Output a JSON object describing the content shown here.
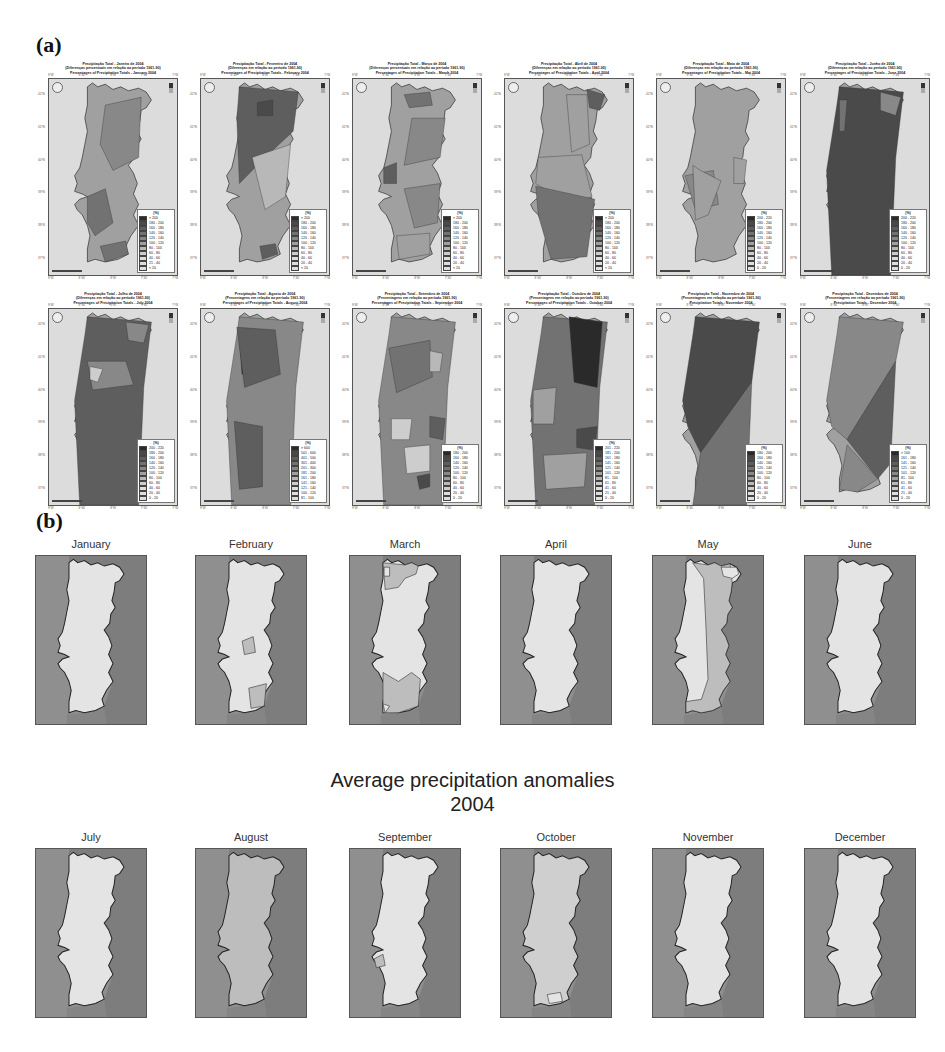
{
  "figure": {
    "panel_a_label": "(a)",
    "panel_b_label": "(b)",
    "center_title_line1": "Average precipitation anomalies",
    "center_title_line2": "2004"
  },
  "panel_a": {
    "legend_unit": "(%)",
    "tick_labels": {
      "top": [
        "9°W",
        "8°30'",
        "8°W",
        "7°30'",
        "7°W"
      ],
      "left": [
        "42°N",
        "41°N",
        "40°N",
        "39°N",
        "38°N",
        "37°N"
      ]
    },
    "maps": [
      {
        "title1": "Precipitação Total - Janeiro de 2004",
        "title2": "(Diferenças percentuais em relação ao período 1961-90)",
        "title3": "Percentages of Precipitation Totals - January 2004",
        "legend": [
          "> 200",
          "180 - 200",
          "160 - 180",
          "140 - 160",
          "120 - 140",
          "100 - 120",
          "80 - 100",
          "60 - 80",
          "40 - 60",
          "21 - 40",
          "< 20"
        ]
      },
      {
        "title1": "Precipitação Total - Fevereiro de 2004",
        "title2": "(Diferenças em relação ao período 1961-90)",
        "title3": "Percentages of Precipitation Totals - February 2004",
        "legend": [
          "> 200",
          "180 - 200",
          "160 - 180",
          "140 - 160",
          "120 - 140",
          "100 - 120",
          "80 - 100",
          "60 - 80",
          "40 - 60",
          "20 - 40",
          "< 20"
        ]
      },
      {
        "title1": "Precipitação Total - Março de 2004",
        "title2": "(Diferenças percentuais em relação ao período 1961-90)",
        "title3": "Percentages of Precipitation Totals - March 2004",
        "legend": [
          "> 200",
          "180 - 200",
          "160 - 180",
          "140 - 160",
          "120 - 140",
          "100 - 120",
          "80 - 100",
          "60 - 80",
          "40 - 60",
          "20 - 40",
          "< 20"
        ]
      },
      {
        "title1": "Precipitação Total - Abril de 2004",
        "title2": "(Diferenças em relação ao período 1961-90)",
        "title3": "Percentages of Precipitation Totals - April 2004",
        "legend": [
          "> 200",
          "180 - 200",
          "160 - 180",
          "140 - 160",
          "120 - 140",
          "100 - 120",
          "80 - 100",
          "60 - 80",
          "40 - 60",
          "20 - 40",
          "< 20"
        ]
      },
      {
        "title1": "Precipitação Total - Maio de 2004",
        "title2": "(Diferenças em relação ao período 1961-90)",
        "title3": "Percentages of Precipitation Totals - Mai 2004",
        "legend": [
          "200 - 220",
          "180 - 200",
          "160 - 180",
          "140 - 160",
          "120 - 140",
          "100 - 120",
          "80 - 100",
          "60 - 80",
          "40 - 60",
          "20 - 40",
          "0 - 20"
        ]
      },
      {
        "title1": "Precipitação Total - Junho de 2004",
        "title2": "(Diferenças em relação ao período 1961-90)",
        "title3": "Percentages of Precipitation Totals - June 2004",
        "legend": [
          "200 - 220",
          "180 - 200",
          "160 - 180",
          "140 - 160",
          "120 - 140",
          "100 - 120",
          "80 - 100",
          "60 - 80",
          "40 - 60",
          "20 - 40",
          "0 - 20"
        ]
      },
      {
        "title1": "Precipitação Total - Julho de 2004",
        "title2": "(Diferenças em relação ao período 1961-90)",
        "title3": "Percentages of Precipitation Totals - July 2004",
        "legend": [
          "200 - 220",
          "180 - 200",
          "160 - 180",
          "140 - 160",
          "120 - 140",
          "100 - 120",
          "80 - 100",
          "60 - 80",
          "40 - 60",
          "20 - 40",
          "0 - 20"
        ]
      },
      {
        "title1": "Precipitação Total - Agosto de 2004",
        "title2": "(Percentagens em relação ao período 1961-90)",
        "title3": "Percentages of Precipitation Totals - August 2004",
        "legend": [
          "> 600",
          "501 - 600",
          "401 - 500",
          "301 - 400",
          "201 - 300",
          "181 - 200",
          "161 - 180",
          "141 - 160",
          "121 - 140",
          "100 - 120",
          "81 - 100"
        ]
      },
      {
        "title1": "Precipitação Total - Setembro de 2004",
        "title2": "(Percentagens em relação ao período 1961-90)",
        "title3": "Percentages of Precipitation Totals - September 2004",
        "legend": [
          "180 - 200",
          "160 - 180",
          "140 - 160",
          "120 - 140",
          "100 - 120",
          "80 - 100",
          "60 - 80",
          "40 - 60",
          "20 - 40",
          "0 - 20"
        ]
      },
      {
        "title1": "Precipitação Total - Outubro de 2004",
        "title2": "(Percentagens em relação ao período 1961-90)",
        "title3": "Percentages of Precipitation Totals - October 2004",
        "legend": [
          "201 - 220",
          "181 - 200",
          "161 - 180",
          "141 - 160",
          "121 - 140",
          "101 - 120",
          "81 - 100",
          "61 - 80",
          "41 - 60",
          "21 - 40",
          "0 - 20"
        ]
      },
      {
        "title1": "Precipitação Total - Novembro de 2004",
        "title2": "(Percentagens em relação ao período 1961-90)",
        "title3": "Precipitation Totals - November 2004",
        "legend": [
          "180 - 200",
          "160 - 180",
          "140 - 160",
          "120 - 140",
          "100 - 120",
          "80 - 100",
          "60 - 80",
          "40 - 60",
          "20 - 40",
          "0 - 20"
        ]
      },
      {
        "title1": "Precipitação Total - Dezembro de 2004",
        "title2": "(Percentagens em relação ao período 1961-90)",
        "title3": "Precipitation Totals - December 2004",
        "legend": [
          "> 100",
          "161 - 180",
          "141 - 160",
          "121 - 140",
          "101 - 120",
          "81 - 100",
          "61 - 80",
          "41 - 60",
          "21 - 40",
          "0 - 20"
        ]
      }
    ]
  },
  "panel_b": {
    "months": [
      "January",
      "February",
      "March",
      "April",
      "May",
      "June",
      "July",
      "August",
      "September",
      "October",
      "November",
      "December"
    ]
  },
  "colors": {
    "sea": "#dcdcdc",
    "b_sea_left": "#8f8f8f",
    "b_spain": "#7d7d7d",
    "b_land_light": "#e4e4e4",
    "b_land_mid": "#bdbdbd",
    "a_shades": [
      "#2a2a2a",
      "#4a4a4a",
      "#5e5e5e",
      "#727272",
      "#888888",
      "#a0a0a0",
      "#b8b8b8",
      "#cdcdcd",
      "#dedede"
    ]
  }
}
